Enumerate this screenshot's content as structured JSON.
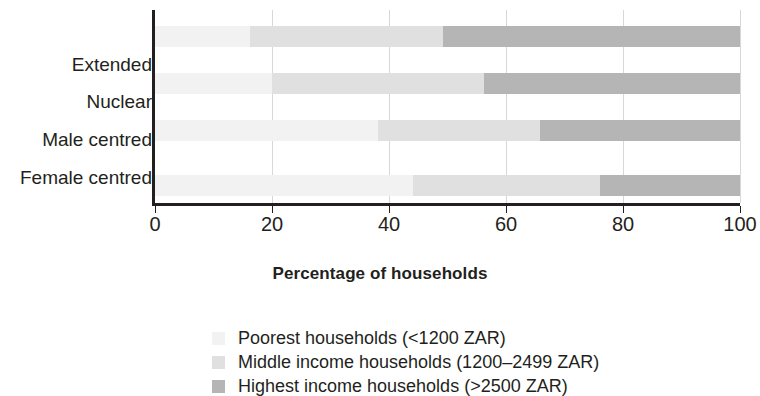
{
  "chart_data": {
    "type": "bar",
    "orientation": "horizontal",
    "stacked": true,
    "stack_total": 100,
    "title": "",
    "xlabel": "Percentage of households",
    "ylabel": "",
    "xlim": [
      0,
      100
    ],
    "xticks": [
      0,
      20,
      40,
      60,
      80,
      100
    ],
    "xtick_labels": [
      "0",
      "20",
      "40",
      "60",
      "80",
      "100"
    ],
    "grid": "vertical",
    "legend_position": "bottom",
    "categories": [
      "Extended",
      "Nuclear",
      "Male centred",
      "Female centred"
    ],
    "series": [
      {
        "name": "Poorest households (<1200 ZAR)",
        "color": "#f2f2f2",
        "values": [
          16.2,
          20.0,
          38.1,
          44.1
        ]
      },
      {
        "name": "Middle income households (1200–2499 ZAR)",
        "color": "#e0e0e0",
        "values": [
          33.0,
          36.2,
          27.7,
          32.0
        ]
      },
      {
        "name": "Highest income households (>2500 ZAR)",
        "color": "#b5b5b5",
        "values": [
          50.8,
          43.8,
          34.2,
          23.9
        ]
      }
    ],
    "cumulative_boundaries": [
      [
        16.2,
        49.2,
        100
      ],
      [
        20.0,
        56.2,
        100
      ],
      [
        38.1,
        65.8,
        100
      ],
      [
        44.1,
        76.1,
        100
      ]
    ]
  },
  "axis": {
    "x_title": "Percentage of households",
    "ticks": [
      {
        "label": "0",
        "value": 0
      },
      {
        "label": "20",
        "value": 20
      },
      {
        "label": "40",
        "value": 40
      },
      {
        "label": "60",
        "value": 60
      },
      {
        "label": "80",
        "value": 80
      },
      {
        "label": "100",
        "value": 100
      }
    ]
  },
  "categories": [
    {
      "label": "Extended"
    },
    {
      "label": "Nuclear"
    },
    {
      "label": "Male centred"
    },
    {
      "label": "Female centred"
    }
  ],
  "legend": {
    "items": [
      {
        "label": "Poorest households (<1200 ZAR)",
        "color": "#f2f2f2"
      },
      {
        "label": "Middle income households (1200–2499 ZAR)",
        "color": "#e0e0e0"
      },
      {
        "label": "Highest income households (>2500 ZAR)",
        "color": "#b5b5b5"
      }
    ]
  },
  "colors": {
    "axis": "#231f20",
    "grid": "#d7d7d7",
    "text": "#231f20",
    "background": "#ffffff"
  }
}
